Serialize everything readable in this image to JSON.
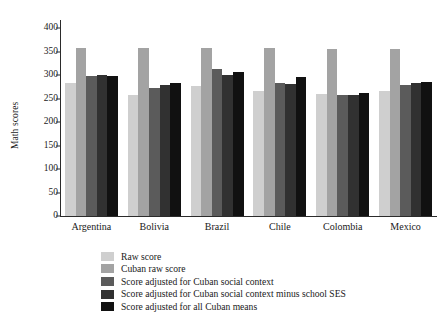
{
  "chart_data": {
    "type": "bar",
    "title": "",
    "subtitle": "",
    "xlabel": "",
    "ylabel": "Math scores",
    "ylim": [
      0,
      400
    ],
    "yticks": [
      0,
      50,
      100,
      150,
      200,
      250,
      300,
      350,
      400
    ],
    "ytick_labels": [
      "0",
      "50",
      "100",
      "150",
      "200",
      "250",
      "300",
      "350",
      "400"
    ],
    "grid": false,
    "legend_position": "bottom-center",
    "categories": [
      "Argentina",
      "Bolivia",
      "Brazil",
      "Chile",
      "Colombia",
      "Mexico"
    ],
    "series": [
      {
        "name": "Raw score",
        "color": "#cfcfcf",
        "values": [
          284,
          258,
          276,
          267,
          260,
          265
        ]
      },
      {
        "name": "Cuban raw score",
        "color": "#a3a3a3",
        "values": [
          357,
          357,
          357,
          357,
          355,
          356
        ]
      },
      {
        "name": "Score adjusted for Cuban social context",
        "color": "#5b5b5b",
        "values": [
          298,
          272,
          312,
          284,
          258,
          279
        ]
      },
      {
        "name": "Score adjusted for Cuban social context minus school SES",
        "color": "#313131",
        "values": [
          301,
          278,
          300,
          280,
          258,
          283
        ]
      },
      {
        "name": "Score adjusted for all Cuban means",
        "color": "#111111",
        "values": [
          298,
          282,
          306,
          295,
          261,
          286
        ]
      }
    ]
  },
  "axis": {
    "color": "#2b2b2b"
  }
}
